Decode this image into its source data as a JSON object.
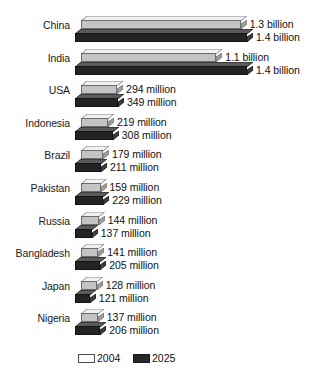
{
  "chart_data": {
    "type": "bar",
    "orientation": "horizontal",
    "title": "",
    "subtitle": "",
    "xlabel": "",
    "ylabel": "",
    "grid": false,
    "legend_position": "bottom",
    "xlim": [
      0,
      1400
    ],
    "units": "millions of people",
    "categories": [
      "China",
      "India",
      "USA",
      "Indonesia",
      "Brazil",
      "Pakistan",
      "Russia",
      "Bangladesh",
      "Japan",
      "Nigeria"
    ],
    "series": [
      {
        "name": "2004",
        "color": "#c4c4c4",
        "values": [
          1300,
          1100,
          294,
          219,
          179,
          159,
          144,
          141,
          128,
          137
        ],
        "labels": [
          "1.3 billion",
          "1.1 billion",
          "294 million",
          "219 million",
          "179 million",
          "159 million",
          "144 million",
          "141 million",
          "128 million",
          "137 million"
        ]
      },
      {
        "name": "2025",
        "color": "#242424",
        "values": [
          1400,
          1400,
          349,
          308,
          211,
          229,
          137,
          205,
          121,
          206
        ],
        "labels": [
          "1.4 billion",
          "1.4 billion",
          "349 million",
          "308 million",
          "211 million",
          "229 million",
          "137 million",
          "205 million",
          "121 million",
          "206 million"
        ]
      }
    ]
  },
  "legend": {
    "items": [
      {
        "label": "2004",
        "swatch": "light"
      },
      {
        "label": "2025",
        "swatch": "dark"
      }
    ]
  }
}
